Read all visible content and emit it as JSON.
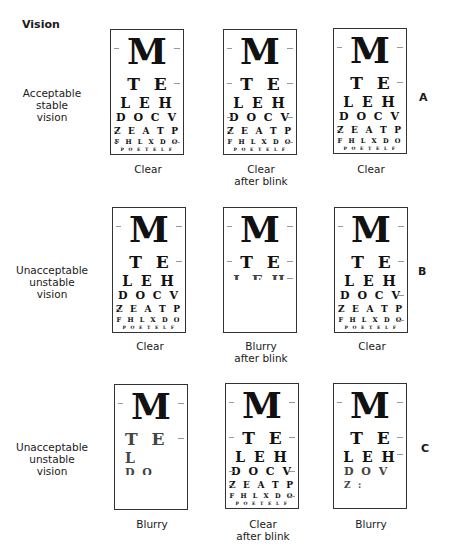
{
  "heading": "Vision",
  "chart_lines": [
    "M",
    "T E",
    "L E H",
    "D O C V",
    "Z E A T P",
    "F H L X D O",
    "P O E T E L F"
  ],
  "rows": [
    {
      "id": "A",
      "label_lines": [
        "Acceptable",
        "stable",
        "vision"
      ],
      "charts": [
        {
          "state": "clear",
          "visible_lines": 7,
          "caption_lines": [
            "Clear"
          ]
        },
        {
          "state": "clear",
          "visible_lines": 7,
          "caption_lines": [
            "Clear",
            "after blink"
          ]
        },
        {
          "state": "clear",
          "visible_lines": 7,
          "caption_lines": [
            "Clear"
          ]
        }
      ]
    },
    {
      "id": "B",
      "label_lines": [
        "Unacceptable",
        "unstable",
        "vision"
      ],
      "charts": [
        {
          "state": "clear",
          "visible_lines": 7,
          "caption_lines": [
            "Clear"
          ]
        },
        {
          "state": "blurry",
          "visible_lines": 2,
          "partial": [
            "L   H",
            "",
            "",
            ""
          ],
          "caption_lines": [
            "Blurry",
            "after blink"
          ]
        },
        {
          "state": "clear",
          "visible_lines": 7,
          "caption_lines": [
            "Clear"
          ]
        }
      ]
    },
    {
      "id": "C",
      "label_lines": [
        "Unacceptable",
        "unstable",
        "vision"
      ],
      "charts": [
        {
          "state": "blurry",
          "visible_lines": 1,
          "partial": [
            "T  E",
            "L  ",
            "D O"
          ],
          "caption_lines": [
            "Blurry"
          ]
        },
        {
          "state": "clear",
          "visible_lines": 7,
          "caption_lines": [
            "Clear",
            "after blink"
          ]
        },
        {
          "state": "blurry",
          "visible_lines": 3,
          "partial": [
            "D O   V",
            "Z :    "
          ],
          "caption_lines": [
            "Blurry"
          ]
        }
      ]
    }
  ]
}
